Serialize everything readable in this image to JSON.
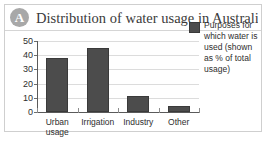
{
  "figure": {
    "badge_label": "A",
    "title": "Distribution of water usage in Australia"
  },
  "legend": {
    "position": "right",
    "swatch_color": "#4c4c4c",
    "text": "Purposes for which water is used (shown as % of total usage)"
  },
  "colors": {
    "bar": "#4c4c4c",
    "bar_border": "#3a3a3a",
    "badge": "#a8a8a8",
    "axis": "#5a5a5a",
    "grid": "#dcdcdc",
    "frame_border": "#cfcfcf",
    "text": "#2e2e2e"
  },
  "chart_data": {
    "type": "bar",
    "title": "Distribution of water usage in Australia",
    "xlabel": "",
    "ylabel": "",
    "categories": [
      "Urban\nusage",
      "Irrigation",
      "Industry",
      "Other"
    ],
    "values": [
      38,
      45,
      11,
      4
    ],
    "series": [
      {
        "name": "Purposes for which water is used (shown as % of total usage)",
        "values": [
          38,
          45,
          11,
          4
        ]
      }
    ],
    "ylim": [
      0,
      50
    ],
    "yticks": [
      0,
      10,
      20,
      30,
      40,
      50
    ],
    "ytick_labels": [
      "0",
      "10",
      "20",
      "30",
      "40",
      "50"
    ],
    "grid": true,
    "legend_position": "right"
  }
}
